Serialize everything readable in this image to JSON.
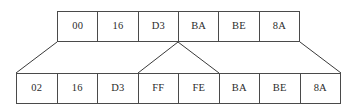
{
  "diagram": {
    "type": "byte-sequence-expansion",
    "colors": {
      "border": "#4a4a4a",
      "text": "#2b2b2b",
      "background": "#ffffff",
      "connector": "#3a3a3a"
    },
    "top_row": {
      "name": "original-byte-sequence",
      "cells": [
        {
          "value": "00"
        },
        {
          "value": "16"
        },
        {
          "value": "D3"
        },
        {
          "value": "BA"
        },
        {
          "value": "BE"
        },
        {
          "value": "8A"
        }
      ]
    },
    "bottom_row": {
      "name": "expanded-byte-sequence",
      "cells": [
        {
          "value": "02"
        },
        {
          "value": "16"
        },
        {
          "value": "D3"
        },
        {
          "value": "FF"
        },
        {
          "value": "FE"
        },
        {
          "value": "BA"
        },
        {
          "value": "BE"
        },
        {
          "value": "8A"
        }
      ]
    },
    "connectors": [
      {
        "name": "left-span-connector",
        "x1": 57,
        "y1": 42,
        "x2": 16,
        "y2": 73
      },
      {
        "name": "middle-split-left-leg",
        "x1": 178,
        "y1": 42,
        "x2": 138,
        "y2": 73
      },
      {
        "name": "middle-split-right-leg",
        "x1": 178,
        "y1": 42,
        "x2": 219,
        "y2": 73
      },
      {
        "name": "right-span-connector",
        "x1": 300,
        "y1": 42,
        "x2": 341,
        "y2": 73
      }
    ]
  }
}
